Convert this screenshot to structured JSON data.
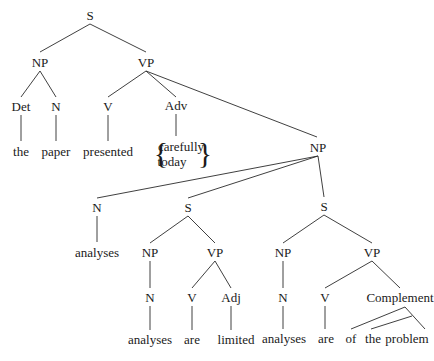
{
  "diagram": {
    "type": "syntax-tree",
    "nodes": [
      {
        "id": "s0",
        "label": "S",
        "x": 90,
        "y": 15
      },
      {
        "id": "np1",
        "label": "NP",
        "x": 40,
        "y": 62
      },
      {
        "id": "vp1",
        "label": "VP",
        "x": 146,
        "y": 62
      },
      {
        "id": "det",
        "label": "Det",
        "x": 21,
        "y": 106
      },
      {
        "id": "n1",
        "label": "N",
        "x": 56,
        "y": 106
      },
      {
        "id": "v1",
        "label": "V",
        "x": 108,
        "y": 106
      },
      {
        "id": "adv",
        "label": "Adv",
        "x": 176,
        "y": 105
      },
      {
        "id": "w_the",
        "label": "the",
        "x": 21,
        "y": 151
      },
      {
        "id": "w_paper",
        "label": "paper",
        "x": 56,
        "y": 151
      },
      {
        "id": "w_presented",
        "label": "presented",
        "x": 108,
        "y": 151
      },
      {
        "id": "w_carefully",
        "label": "carefully",
        "x": 181,
        "y": 146
      },
      {
        "id": "w_today",
        "label": "today",
        "x": 172,
        "y": 161
      },
      {
        "id": "np2",
        "label": "NP",
        "x": 318,
        "y": 147
      },
      {
        "id": "n2",
        "label": "N",
        "x": 97,
        "y": 207
      },
      {
        "id": "s1",
        "label": "S",
        "x": 188,
        "y": 207
      },
      {
        "id": "s2",
        "label": "S",
        "x": 324,
        "y": 206
      },
      {
        "id": "w_analyses1",
        "label": "analyses",
        "x": 97,
        "y": 252
      },
      {
        "id": "np3",
        "label": "NP",
        "x": 150,
        "y": 252
      },
      {
        "id": "vp2",
        "label": "VP",
        "x": 215,
        "y": 252
      },
      {
        "id": "np4",
        "label": "NP",
        "x": 283,
        "y": 252
      },
      {
        "id": "vp3",
        "label": "VP",
        "x": 372,
        "y": 252
      },
      {
        "id": "n3",
        "label": "N",
        "x": 150,
        "y": 297
      },
      {
        "id": "v2",
        "label": "V",
        "x": 192,
        "y": 297
      },
      {
        "id": "adj",
        "label": "Adj",
        "x": 231,
        "y": 297
      },
      {
        "id": "n4",
        "label": "N",
        "x": 283,
        "y": 297
      },
      {
        "id": "v3",
        "label": "V",
        "x": 325,
        "y": 297
      },
      {
        "id": "comp",
        "label": "Complement",
        "x": 400,
        "y": 297
      },
      {
        "id": "w_analyses2",
        "label": "analyses",
        "x": 150,
        "y": 339
      },
      {
        "id": "w_are1",
        "label": "are",
        "x": 192,
        "y": 339
      },
      {
        "id": "w_limited",
        "label": "limited",
        "x": 236,
        "y": 339
      },
      {
        "id": "w_analyses3",
        "label": "analyses",
        "x": 284,
        "y": 338
      },
      {
        "id": "w_are2",
        "label": "are",
        "x": 326,
        "y": 338
      },
      {
        "id": "w_of",
        "label": "of",
        "x": 351,
        "y": 338
      },
      {
        "id": "w_the2",
        "label": "the",
        "x": 373,
        "y": 338
      },
      {
        "id": "w_problem",
        "label": "problem",
        "x": 407,
        "y": 338
      }
    ],
    "edges": [
      [
        90,
        24,
        40,
        52
      ],
      [
        90,
        24,
        146,
        52
      ],
      [
        40,
        71,
        21,
        97
      ],
      [
        40,
        71,
        56,
        97
      ],
      [
        21,
        115,
        21,
        141
      ],
      [
        56,
        115,
        56,
        141
      ],
      [
        146,
        71,
        108,
        97
      ],
      [
        146,
        71,
        176,
        97
      ],
      [
        146,
        71,
        317,
        137
      ],
      [
        108,
        115,
        108,
        141
      ],
      [
        176,
        114,
        176,
        136
      ],
      [
        318,
        156,
        97,
        198
      ],
      [
        318,
        156,
        188,
        198
      ],
      [
        318,
        156,
        324,
        197
      ],
      [
        97,
        216,
        97,
        242
      ],
      [
        188,
        216,
        150,
        243
      ],
      [
        188,
        216,
        215,
        243
      ],
      [
        324,
        215,
        283,
        243
      ],
      [
        324,
        215,
        372,
        243
      ],
      [
        150,
        261,
        150,
        288
      ],
      [
        215,
        261,
        192,
        288
      ],
      [
        215,
        261,
        231,
        288
      ],
      [
        283,
        261,
        283,
        288
      ],
      [
        372,
        261,
        325,
        288
      ],
      [
        372,
        261,
        400,
        288
      ],
      [
        150,
        306,
        150,
        330
      ],
      [
        192,
        306,
        192,
        330
      ],
      [
        231,
        306,
        231,
        330
      ],
      [
        283,
        306,
        283,
        329
      ],
      [
        325,
        306,
        325,
        329
      ],
      [
        405,
        307,
        351,
        329
      ],
      [
        405,
        307,
        425,
        329
      ],
      [
        412,
        316,
        371,
        329
      ]
    ],
    "braces": {
      "left": "{",
      "right": "}",
      "left_x": 161,
      "right_x": 205,
      "y": 153
    }
  }
}
